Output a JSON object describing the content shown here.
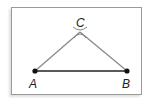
{
  "diagram": {
    "type": "geometric-construction",
    "points": [
      {
        "label": "A",
        "x": 35,
        "y": 71
      },
      {
        "label": "B",
        "x": 127,
        "y": 71
      },
      {
        "label": "C",
        "x": 80,
        "y": 32
      }
    ],
    "segments": [
      {
        "from": "A",
        "to": "B",
        "color": "#222222",
        "width": 1.5
      },
      {
        "from": "A",
        "to": "C",
        "color": "#888888",
        "width": 1.2
      },
      {
        "from": "B",
        "to": "C",
        "color": "#888888",
        "width": 1.2
      }
    ],
    "labels": {
      "a": "A",
      "b": "B",
      "c": "C"
    }
  }
}
